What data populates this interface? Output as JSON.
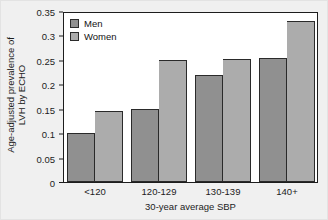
{
  "chart_data": {
    "type": "bar",
    "title": "",
    "xlabel": "30-year average SBP",
    "ylabel_line1": "Age-adjusted prevalence of",
    "ylabel_line2": "LVH by ECHO",
    "categories": [
      "<120",
      "120-129",
      "130-139",
      "140+"
    ],
    "series": [
      {
        "name": "Men",
        "color": "#909090",
        "values": [
          0.1,
          0.15,
          0.22,
          0.254
        ]
      },
      {
        "name": "Women",
        "color": "#acacac",
        "values": [
          0.146,
          0.249,
          0.251,
          0.329
        ]
      }
    ],
    "ylim": [
      0,
      0.35
    ],
    "yticks": [
      "0",
      "0.05",
      "0.1",
      "0.15",
      "0.2",
      "0.25",
      "0.3",
      "0.35"
    ],
    "ytick_values": [
      0,
      0.05,
      0.1,
      0.15,
      0.2,
      0.25,
      0.3,
      0.35
    ],
    "grid": false,
    "legend_position": "top-left"
  },
  "legend": {
    "entries": [
      {
        "label": "Men"
      },
      {
        "label": "Women"
      }
    ]
  }
}
